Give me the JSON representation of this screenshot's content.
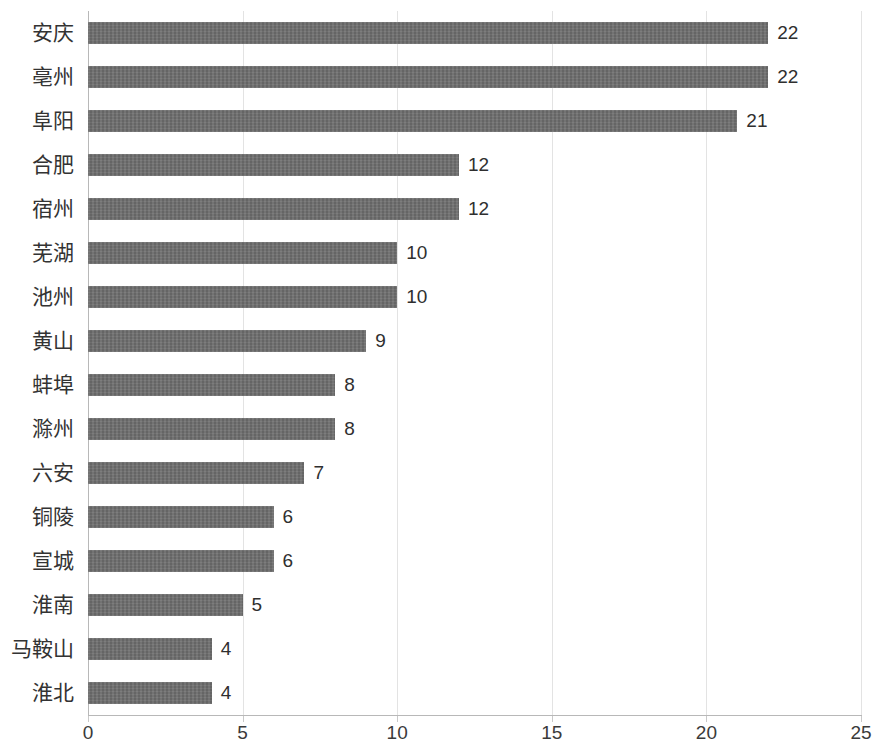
{
  "chart_data": {
    "type": "bar",
    "orientation": "horizontal",
    "title": "",
    "subtitle": "",
    "xlabel": "",
    "ylabel": "",
    "xlim": [
      0,
      25
    ],
    "xticks": [
      "0",
      "5",
      "10",
      "15",
      "20",
      "25"
    ],
    "xtick_values": [
      0,
      5,
      10,
      15,
      20,
      25
    ],
    "grid": true,
    "grid_axis": "x",
    "legend": false,
    "legend_position": "none",
    "data_labels": true,
    "categories": [
      "安庆",
      "亳州",
      "阜阳",
      "合肥",
      "宿州",
      "芜湖",
      "池州",
      "黄山",
      "蚌埠",
      "滁州",
      "六安",
      "铜陵",
      "宣城",
      "淮南",
      "马鞍山",
      "淮北"
    ],
    "values": [
      22,
      22,
      21,
      12,
      12,
      10,
      10,
      9,
      8,
      8,
      7,
      6,
      6,
      5,
      4,
      4
    ],
    "value_labels": [
      "22",
      "22",
      "21",
      "12",
      "12",
      "10",
      "10",
      "9",
      "8",
      "8",
      "7",
      "6",
      "6",
      "5",
      "4",
      "4"
    ],
    "series": [
      {
        "name": "",
        "values": [
          22,
          22,
          21,
          12,
          12,
          10,
          10,
          9,
          8,
          8,
          7,
          6,
          6,
          5,
          4,
          4
        ]
      }
    ]
  },
  "style": {
    "bar_color": "#6e6e6e",
    "grid_color": "#e3e3e3",
    "axis_color": "#b8b8b8",
    "text_color": "#3a3a3a",
    "background": "#ffffff"
  }
}
